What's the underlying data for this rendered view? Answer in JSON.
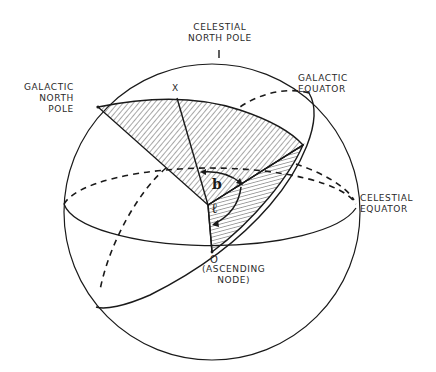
{
  "figure": {
    "type": "celestial-sphere-diagram",
    "labels": {
      "celestial_north_pole": "CELESTIAL\nNORTH POLE",
      "galactic_north_pole": "GALACTIC\nNORTH\nPOLE",
      "galactic_equator": "GALACTIC\nEQUATOR",
      "celestial_equator": "CELESTIAL\nEQUATOR",
      "point_x": "X",
      "ascending_node_symbol": "O",
      "ascending_node": "(ASCENDING\nNODE)",
      "angle_b": "b",
      "angle_l": "ℓ"
    },
    "colors": {
      "ink": "#1a1a1a",
      "background": "#ffffff"
    }
  }
}
